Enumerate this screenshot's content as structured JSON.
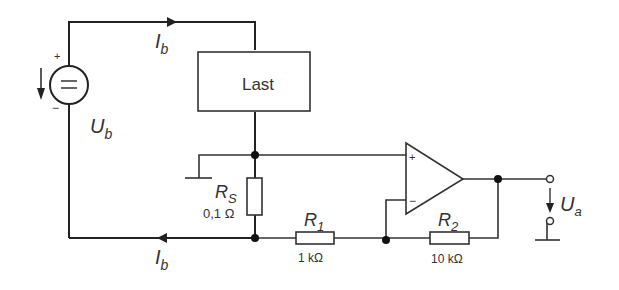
{
  "diagram": {
    "type": "circuit",
    "source": {
      "label": "U",
      "subscript": "b",
      "plus": "+",
      "minus": "−",
      "symbol": "="
    },
    "load": {
      "label": "Last"
    },
    "current_top": {
      "label": "I",
      "subscript": "b"
    },
    "current_bottom": {
      "label": "I",
      "subscript": "b"
    },
    "rs": {
      "label": "R",
      "subscript": "S",
      "value": "0,1 Ω"
    },
    "r1": {
      "label": "R",
      "subscript": "1",
      "value": "1 kΩ"
    },
    "r2": {
      "label": "R",
      "subscript": "2",
      "value": "10 kΩ"
    },
    "opamp": {
      "plus": "+",
      "minus": "−"
    },
    "output": {
      "label": "U",
      "subscript": "a"
    }
  }
}
